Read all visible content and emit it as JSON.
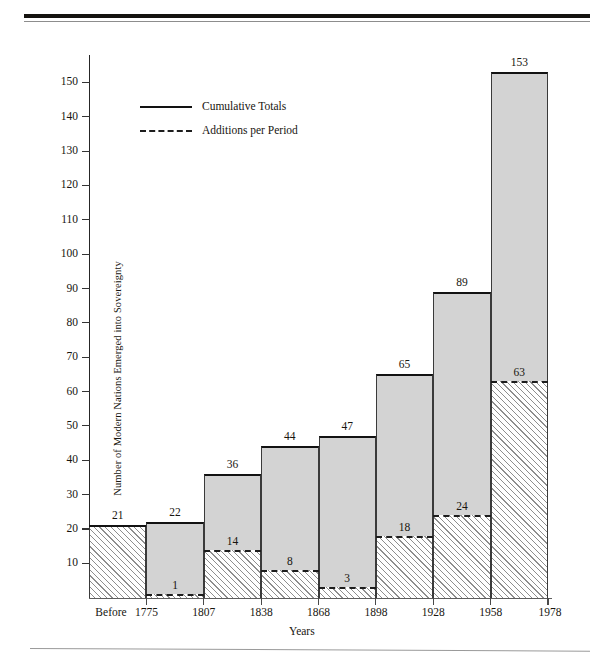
{
  "chart_data": {
    "type": "bar",
    "title": "",
    "xlabel": "Years",
    "ylabel": "Number of Modern Nations Emerged into Sovereignty",
    "categories": [
      "Before 1775",
      "1775–1807",
      "1807–1838",
      "1838–1868",
      "1868–1898",
      "1898–1928",
      "1928–1958",
      "1958–1978"
    ],
    "boundaries": [
      "Before",
      "1775",
      "1807",
      "1838",
      "1868",
      "1898",
      "1928",
      "1958",
      "1978"
    ],
    "series": [
      {
        "name": "Cumulative Totals",
        "values": [
          21,
          22,
          36,
          44,
          47,
          65,
          89,
          153
        ]
      },
      {
        "name": "Additions per Period",
        "values": [
          21,
          1,
          14,
          8,
          3,
          18,
          24,
          63
        ]
      }
    ],
    "ylim": [
      0,
      158
    ],
    "yticks": [
      10,
      20,
      30,
      40,
      50,
      60,
      70,
      80,
      90,
      100,
      110,
      120,
      130,
      140,
      150
    ],
    "grid": false,
    "legend_position": "upper-left-inside"
  },
  "legend": {
    "items": [
      {
        "label": "Cumulative Totals",
        "style": "solid"
      },
      {
        "label": "Additions per Period",
        "style": "dashed"
      }
    ]
  },
  "axes": {
    "y_title": "Number of Modern Nations Emerged into Sovereignty",
    "x_title": "Years",
    "y_tick_labels": [
      "10",
      "20",
      "30",
      "40",
      "50",
      "60",
      "70",
      "80",
      "90",
      "100",
      "110",
      "120",
      "130",
      "140",
      "150"
    ],
    "x_tick_labels": [
      "Before",
      "1775",
      "1807",
      "1838",
      "1868",
      "1898",
      "1928",
      "1958",
      "1978"
    ]
  },
  "bar_labels": {
    "cumulative": [
      "21",
      "22",
      "36",
      "44",
      "47",
      "65",
      "89",
      "153"
    ],
    "additions": [
      "",
      "1",
      "14",
      "8",
      "3",
      "18",
      "24",
      "63"
    ]
  },
  "colors": {
    "bar_fill": "#d3d3d3",
    "bar_outline": "#121212",
    "hatch_line": "#8e8e8e",
    "rule": "#15130f"
  },
  "footer": {
    "note": ""
  }
}
